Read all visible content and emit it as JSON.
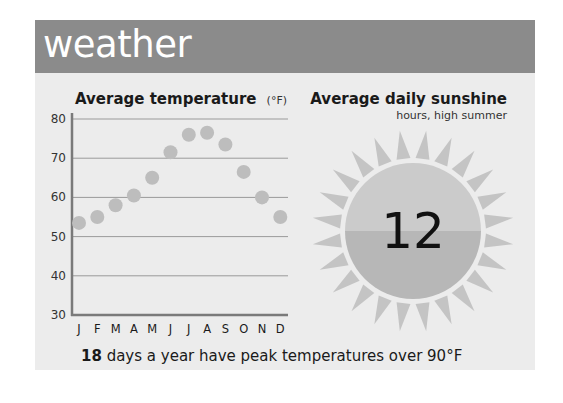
{
  "header": {
    "title": "weather"
  },
  "temperature_chart": {
    "title": "Average temperature",
    "unit": "(°F)"
  },
  "sunshine": {
    "title": "Average daily sunshine",
    "subtitle": "hours, high summer",
    "value": "12"
  },
  "footer": {
    "highlight": "18",
    "text": " days a year have peak temperatures over 90°F"
  },
  "colors": {
    "header_bg": "#8b8b8b",
    "panel_bg": "#ececec",
    "dot": "#bdbdbd",
    "sun_top": "#cbcbcb",
    "sun_bottom": "#b7b7b7",
    "ray": "#c4c4c4"
  },
  "chart_data": [
    {
      "type": "scatter",
      "title": "Average temperature (°F)",
      "xlabel": "",
      "ylabel": "",
      "categories": [
        "J",
        "F",
        "M",
        "A",
        "M",
        "J",
        "J",
        "A",
        "S",
        "O",
        "N",
        "D"
      ],
      "values": [
        53.5,
        55,
        58,
        60.5,
        65,
        71.5,
        76,
        76.5,
        73.5,
        66.5,
        60,
        55
      ],
      "ylim": [
        30,
        80
      ],
      "yticks": [
        30,
        40,
        50,
        60,
        70,
        80
      ],
      "grid": true
    },
    {
      "type": "table",
      "title": "Average daily sunshine",
      "subtitle": "hours, high summer",
      "value": 12
    }
  ]
}
